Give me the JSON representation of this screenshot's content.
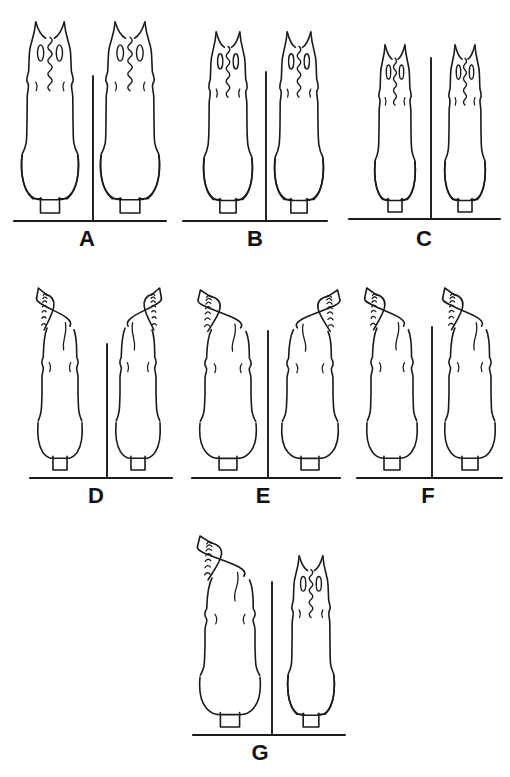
{
  "figure": {
    "kind": "scientific-illustration-plate",
    "background_color": "#ffffff",
    "ink_color": "#1a1a1a",
    "line_width_px": 1.6,
    "panel_count": 7
  },
  "panels": [
    {
      "id": "A",
      "label": "A",
      "label_x": 87,
      "label_y": 232,
      "baseline": {
        "x1": 14,
        "x2": 166,
        "y": 221
      },
      "divider": {
        "x": 93,
        "y1": 76,
        "y2": 220
      },
      "apex_type": "straight-bifid",
      "specimens": [
        {
          "side": "left",
          "cx": 50,
          "top": 22,
          "bottom": 213,
          "body_width": 46,
          "bulb_width": 56,
          "apex": "bifid-horn"
        },
        {
          "side": "right",
          "cx": 130,
          "top": 22,
          "bottom": 213,
          "body_width": 48,
          "bulb_width": 58,
          "apex": "bifid-horn"
        }
      ]
    },
    {
      "id": "B",
      "label": "B",
      "label_x": 249,
      "label_y": 232,
      "baseline": {
        "x1": 183,
        "x2": 327,
        "y": 221
      },
      "divider": {
        "x": 266,
        "y1": 72,
        "y2": 220
      },
      "apex_type": "straight-bifid",
      "specimens": [
        {
          "side": "left",
          "cx": 228,
          "top": 32,
          "bottom": 213,
          "body_width": 38,
          "bulb_width": 48,
          "apex": "bifid-horn"
        },
        {
          "side": "right",
          "cx": 299,
          "top": 32,
          "bottom": 213,
          "body_width": 38,
          "bulb_width": 48,
          "apex": "bifid-horn"
        }
      ]
    },
    {
      "id": "C",
      "label": "C",
      "label_x": 414,
      "label_y": 232,
      "baseline": {
        "x1": 349,
        "x2": 500,
        "y": 219
      },
      "divider": {
        "x": 431,
        "y1": 58,
        "y2": 218
      },
      "apex_type": "straight-bifid",
      "specimens": [
        {
          "side": "left",
          "cx": 395,
          "top": 45,
          "bottom": 212,
          "body_width": 32,
          "bulb_width": 40,
          "apex": "bifid-horn"
        },
        {
          "side": "right",
          "cx": 465,
          "top": 45,
          "bottom": 212,
          "body_width": 32,
          "bulb_width": 40,
          "apex": "bifid-horn"
        }
      ]
    },
    {
      "id": "D",
      "label": "D",
      "label_x": 95,
      "label_y": 489,
      "baseline": {
        "x1": 30,
        "x2": 172,
        "y": 478
      },
      "divider": {
        "x": 107,
        "y1": 344,
        "y2": 477
      },
      "apex_type": "hooked-serrate",
      "specimens": [
        {
          "side": "left",
          "cx": 60,
          "top": 288,
          "bottom": 470,
          "body_width": 36,
          "bulb_width": 44,
          "apex": "hook-left"
        },
        {
          "side": "right",
          "cx": 138,
          "top": 288,
          "bottom": 470,
          "body_width": 36,
          "bulb_width": 44,
          "apex": "hook-right"
        }
      ]
    },
    {
      "id": "E",
      "label": "E",
      "label_x": 259,
      "label_y": 489,
      "baseline": {
        "x1": 192,
        "x2": 340,
        "y": 478
      },
      "divider": {
        "x": 268,
        "y1": 331,
        "y2": 477
      },
      "apex_type": "hooked-serrate",
      "specimens": [
        {
          "side": "left",
          "cx": 228,
          "top": 290,
          "bottom": 470,
          "body_width": 46,
          "bulb_width": 56,
          "apex": "hook-left"
        },
        {
          "side": "right",
          "cx": 310,
          "top": 290,
          "bottom": 470,
          "body_width": 46,
          "bulb_width": 56,
          "apex": "hook-right"
        }
      ]
    },
    {
      "id": "F",
      "label": "F",
      "label_x": 424,
      "label_y": 489,
      "baseline": {
        "x1": 357,
        "x2": 502,
        "y": 478
      },
      "divider": {
        "x": 432,
        "y1": 327,
        "y2": 477
      },
      "apex_type": "hooked-serrate",
      "specimens": [
        {
          "side": "left",
          "cx": 392,
          "top": 288,
          "bottom": 470,
          "body_width": 42,
          "bulb_width": 50,
          "apex": "hook-left"
        },
        {
          "side": "right",
          "cx": 470,
          "top": 288,
          "bottom": 470,
          "body_width": 42,
          "bulb_width": 50,
          "apex": "hook-left"
        }
      ]
    },
    {
      "id": "G",
      "label": "G",
      "label_x": 253,
      "label_y": 746,
      "baseline": {
        "x1": 193,
        "x2": 345,
        "y": 735
      },
      "divider": {
        "x": 272,
        "y1": 582,
        "y2": 734
      },
      "apex_type": "mixed",
      "specimens": [
        {
          "side": "left",
          "cx": 230,
          "top": 536,
          "bottom": 727,
          "body_width": 50,
          "bulb_width": 60,
          "apex": "hook-left"
        },
        {
          "side": "right",
          "cx": 311,
          "top": 556,
          "bottom": 727,
          "body_width": 38,
          "bulb_width": 46,
          "apex": "bifid-horn"
        }
      ]
    }
  ],
  "labels": {
    "a": "A",
    "b": "B",
    "c": "C",
    "d": "D",
    "e": "E",
    "f": "F",
    "g": "G"
  }
}
